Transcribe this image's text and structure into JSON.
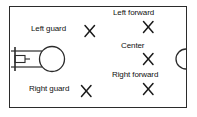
{
  "diagram": {
    "type": "basketball-court-diagram",
    "colors": {
      "line": "#2b2b2b",
      "text": "#111111",
      "background": "#ffffff"
    },
    "frame": {
      "shape": "rectangle",
      "description": "court boundary"
    },
    "court_features": [
      {
        "name": "backboard",
        "shape": "vertical-line",
        "side": "left"
      },
      {
        "name": "hoop",
        "shape": "small-rectangle",
        "side": "left"
      },
      {
        "name": "free-throw-lane",
        "shape": "two-horizontal-lines",
        "side": "left"
      },
      {
        "name": "free-throw-circle",
        "shape": "circle",
        "side": "left"
      },
      {
        "name": "center-circle-arc",
        "shape": "half-circle",
        "side": "right"
      }
    ],
    "positions": [
      {
        "id": "left-guard",
        "label": "Left guard",
        "marker": "X",
        "marker_x": 90,
        "marker_y": 31
      },
      {
        "id": "right-guard",
        "label": "Right guard",
        "marker": "X",
        "marker_x": 86,
        "marker_y": 91
      },
      {
        "id": "left-forward",
        "label": "Left forward",
        "marker": "X",
        "marker_x": 148,
        "marker_y": 27
      },
      {
        "id": "center",
        "label": "Center",
        "marker": "X",
        "marker_x": 148,
        "marker_y": 59
      },
      {
        "id": "right-forward",
        "label": "Right forward",
        "marker": "X",
        "marker_x": 148,
        "marker_y": 89
      }
    ]
  }
}
